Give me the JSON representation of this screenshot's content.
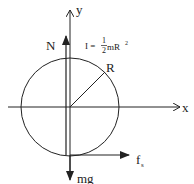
{
  "diagram": {
    "type": "free-body-diagram",
    "axes": {
      "x_label": "x",
      "y_label": "y"
    },
    "forces": [
      {
        "name": "normal",
        "label": "N",
        "direction": "up"
      },
      {
        "name": "gravity",
        "label": "mg",
        "direction": "down"
      },
      {
        "name": "static-friction",
        "label": "f",
        "subscript": "s",
        "direction": "right"
      }
    ],
    "radius_label": "R",
    "moment_of_inertia": {
      "prefix": "I =",
      "numerator": "1",
      "denominator": "2",
      "suffix": "mR",
      "exponent": "2"
    },
    "colors": {
      "stroke": "#222222",
      "background": "#ffffff"
    }
  }
}
